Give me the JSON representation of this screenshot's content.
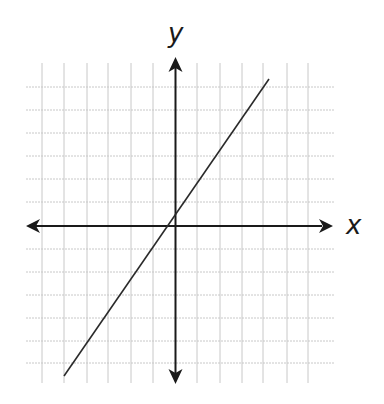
{
  "chart_data": {
    "type": "line",
    "title": "",
    "xlabel": "x",
    "ylabel": "y",
    "grid": true,
    "tick_labels": false,
    "xlim": [
      -6.7,
      7.2
    ],
    "ylim": [
      -6.9,
      7.0
    ],
    "grid_spacing": 1,
    "series": [
      {
        "name": "line",
        "equation_approx": "y = 1.4x + 0.5",
        "x": [
          -5,
          4.2
        ],
        "y": [
          -6.5,
          6.4
        ]
      }
    ],
    "annotations": []
  },
  "labels": {
    "x": "x",
    "y": "y"
  },
  "colors": {
    "grid": "#c8c8c8",
    "axis": "#1a1a1a",
    "line": "#2a2a2a",
    "background": "#ffffff"
  }
}
